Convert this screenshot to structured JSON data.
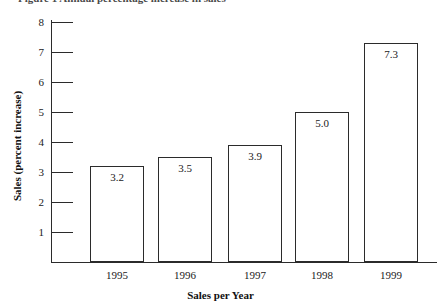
{
  "figure": {
    "cutoff_text": "Figure 1  Annual percentage increase in sales",
    "chart_data": {
      "type": "bar",
      "title": "",
      "xlabel": "Sales per Year",
      "ylabel": "Sales (percent increase)",
      "categories": [
        "1995",
        "1996",
        "1997",
        "1998",
        "1999"
      ],
      "values": [
        3.2,
        3.5,
        3.9,
        5.0,
        7.3
      ],
      "value_labels": [
        "3.2",
        "3.5",
        "3.9",
        "5.0",
        "7.3"
      ],
      "ylim": [
        0,
        8
      ],
      "yticks": [
        1,
        2,
        3,
        4,
        5,
        6,
        7,
        8
      ],
      "ytick_labels": [
        "1",
        "2",
        "3",
        "4",
        "5",
        "6",
        "7",
        "8"
      ],
      "grid": false,
      "legend": false,
      "bar_fill_color": "#ffffff",
      "bar_edge_color": "#2b2b2b",
      "axis_color": "#2b2b2b"
    }
  }
}
